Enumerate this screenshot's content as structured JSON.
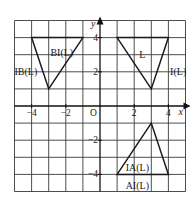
{
  "diagram": {
    "type": "coordinate-grid-transformations",
    "x_range": [
      -5,
      5
    ],
    "y_range": [
      -5,
      5
    ],
    "axis_labels": {
      "x": "x",
      "y": "y",
      "origin": "O"
    },
    "x_ticks": [
      {
        "value": -4,
        "label": "−4"
      },
      {
        "value": -2,
        "label": "−2"
      },
      {
        "value": 2,
        "label": "2"
      },
      {
        "value": 4,
        "label": "4"
      }
    ],
    "y_ticks": [
      {
        "value": 4,
        "label": "4"
      },
      {
        "value": 2,
        "label": "2"
      },
      {
        "value": -2,
        "label": "−2"
      },
      {
        "value": -4,
        "label": "−4"
      }
    ],
    "triangles": [
      {
        "name": "L",
        "vertices": [
          [
            1,
            4
          ],
          [
            4,
            4
          ],
          [
            3,
            1
          ]
        ],
        "labels": [
          {
            "text": "L",
            "at": [
              2.3,
              3.0
            ]
          },
          {
            "text": "I(L)",
            "at": [
              4.1,
              2.0
            ]
          }
        ]
      },
      {
        "name": "BI(L)",
        "vertices": [
          [
            -4,
            4
          ],
          [
            -1,
            4
          ],
          [
            -3,
            1
          ]
        ],
        "labels": [
          {
            "text": "BI(L)",
            "at": [
              -2.9,
              3.1
            ]
          },
          {
            "text": "IB(L)",
            "at": [
              -5.0,
              2.0
            ]
          }
        ]
      },
      {
        "name": "IA(L)",
        "vertices": [
          [
            1,
            -4
          ],
          [
            4,
            -4
          ],
          [
            3,
            -1
          ]
        ],
        "labels": [
          {
            "text": "IA(L)",
            "at": [
              1.5,
              -3.6
            ]
          },
          {
            "text": "AI(L)",
            "at": [
              1.5,
              -4.7
            ]
          }
        ]
      }
    ],
    "colors": {
      "line": "#1a1a1a",
      "grid": "#3a3a3a",
      "background": "#ffffff"
    }
  }
}
